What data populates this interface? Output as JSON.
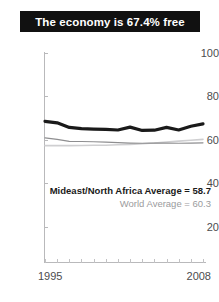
{
  "title": {
    "text": "The economy is 67.4% free",
    "banner_color": "#111111",
    "text_color": "#ffffff"
  },
  "annotations": {
    "region_average": "Mideast/North Africa Average = 58.7",
    "world_average": "World Average = 60.3"
  },
  "chart_data": {
    "type": "line",
    "title": "The economy is 67.4% free",
    "xlabel": "",
    "ylabel": "",
    "xlim": [
      1995,
      2008
    ],
    "ylim": [
      0,
      100
    ],
    "yticks": [
      20,
      40,
      60,
      80,
      100
    ],
    "xticks": [
      1995,
      1996,
      1997,
      1998,
      1999,
      2000,
      2001,
      2002,
      2003,
      2004,
      2005,
      2006,
      2007,
      2008
    ],
    "xtick_labels_shown": [
      "1995",
      "2008"
    ],
    "grid": false,
    "legend_position": "inline-annotation",
    "x": [
      1995,
      1996,
      1997,
      1998,
      1999,
      2000,
      2001,
      2002,
      2003,
      2004,
      2005,
      2006,
      2007,
      2008
    ],
    "series": [
      {
        "name": "Country",
        "color": "#1a1a1a",
        "width": 3.2,
        "values": [
          68.6,
          67.9,
          65.8,
          65.2,
          65.0,
          64.9,
          64.6,
          65.9,
          64.4,
          64.5,
          65.8,
          64.6,
          66.3,
          67.4
        ]
      },
      {
        "name": "Mideast/North Africa Average",
        "color": "#8e8e90",
        "width": 1.2,
        "values": [
          61.0,
          60.3,
          59.4,
          59.3,
          59.2,
          59.0,
          58.8,
          58.6,
          58.5,
          58.6,
          58.6,
          58.5,
          58.6,
          58.7
        ]
      },
      {
        "name": "World Average",
        "color": "#cfcfd1",
        "width": 1.6,
        "values": [
          57.4,
          57.4,
          57.4,
          57.5,
          57.6,
          57.6,
          57.8,
          58.0,
          58.3,
          58.6,
          59.1,
          59.5,
          59.9,
          60.3
        ]
      }
    ]
  },
  "y_tick_labels": [
    "100",
    "80",
    "60",
    "40",
    "20"
  ],
  "x_tick_labels": {
    "start": "1995",
    "end": "2008"
  }
}
